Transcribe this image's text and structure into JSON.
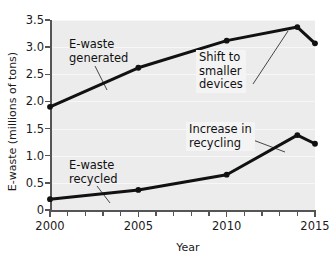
{
  "chart_data": {
    "type": "line",
    "title": "",
    "xlabel": "Year",
    "ylabel": "E-waste (millions of tons)",
    "xlim": [
      2000,
      2015
    ],
    "ylim": [
      0,
      3.5
    ],
    "yticks": [
      0,
      0.5,
      1.0,
      1.5,
      2.0,
      2.5,
      3.0,
      3.5
    ],
    "ytick_labels": [
      "0",
      "0.5",
      "1.0",
      "1.5",
      "2.0",
      "2.5",
      "3.0",
      "3.5"
    ],
    "xticks": [
      2000,
      2001,
      2002,
      2003,
      2004,
      2005,
      2006,
      2007,
      2008,
      2009,
      2010,
      2011,
      2012,
      2013,
      2014,
      2015
    ],
    "xtick_labels": [
      "2000",
      "",
      "",
      "",
      "",
      "2005",
      "",
      "",
      "",
      "",
      "2010",
      "",
      "",
      "",
      "",
      "2015"
    ],
    "grid": true,
    "legend": "none",
    "series": [
      {
        "name": "E-waste generated",
        "color": "#111111",
        "x": [
          2000,
          2005,
          2010,
          2014,
          2015
        ],
        "values": [
          1.9,
          2.62,
          3.12,
          3.37,
          3.07
        ]
      },
      {
        "name": "E-waste recycled",
        "color": "#111111",
        "x": [
          2000,
          2005,
          2010,
          2014,
          2015
        ],
        "values": [
          0.2,
          0.37,
          0.65,
          1.38,
          1.22
        ]
      }
    ],
    "annotations": [
      {
        "id": "generated",
        "text": "E-waste\ngenerated",
        "x": 2003.8,
        "y": 3.08
      },
      {
        "id": "recycled",
        "text": "E-waste\nrecycled",
        "x": 2003.8,
        "y": 0.97
      },
      {
        "id": "shift",
        "text": "Shift to\nsmaller\ndevices",
        "x": 2010.9,
        "y": 2.86
      },
      {
        "id": "increase",
        "text": "Increase in\nrecycling",
        "x": 2010.2,
        "y": 1.6
      }
    ]
  }
}
